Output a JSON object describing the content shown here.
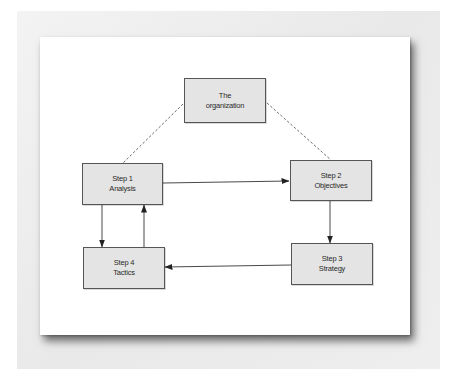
{
  "diagram": {
    "type": "flowchart",
    "nodes": [
      {
        "id": "organization",
        "line1": "The",
        "line2": "organization"
      },
      {
        "id": "step1",
        "line1": "Step 1",
        "line2": "Analysis"
      },
      {
        "id": "step2",
        "line1": "Step 2",
        "line2": "Objectives"
      },
      {
        "id": "step3",
        "line1": "Step 3",
        "line2": "Strategy"
      },
      {
        "id": "step4",
        "line1": "Step 4",
        "line2": "Tactics"
      }
    ],
    "edges": [
      {
        "from": "organization",
        "to": "step1",
        "style": "dashed",
        "arrow": false
      },
      {
        "from": "organization",
        "to": "step2",
        "style": "dashed",
        "arrow": false
      },
      {
        "from": "step1",
        "to": "step2",
        "style": "solid",
        "arrow": true
      },
      {
        "from": "step2",
        "to": "step3",
        "style": "solid",
        "arrow": true
      },
      {
        "from": "step3",
        "to": "step4",
        "style": "solid",
        "arrow": true
      },
      {
        "from": "step1",
        "to": "step4",
        "style": "solid",
        "arrow": true
      },
      {
        "from": "step4",
        "to": "step1",
        "style": "solid",
        "arrow": true
      }
    ],
    "colors": {
      "node_fill": "#e4e4e4",
      "node_border": "#555555",
      "line": "#333333",
      "card": "#ffffff",
      "backdrop": "#ececec"
    }
  }
}
